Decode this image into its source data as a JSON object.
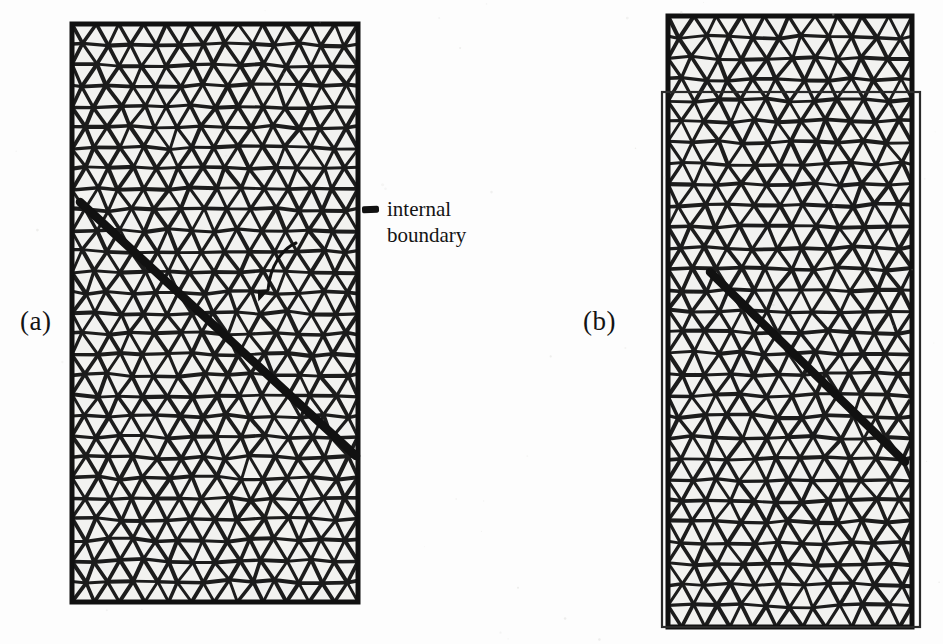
{
  "figure": {
    "kind": "finite-element-mesh-figure",
    "background_color": "#fdfdfd",
    "line_color": "#1c1c1c",
    "face_color": "#f2f2f0",
    "panels": [
      {
        "id": "a",
        "label": "(a)",
        "label_x": 20,
        "label_y": 306,
        "mesh": {
          "x": 72,
          "y": 24,
          "width": 286,
          "height": 578,
          "cell_size": 24.0,
          "border_width": 5,
          "edge_width": 3.4,
          "jitter": 2.6,
          "seed": 17
        },
        "outer_rect": null,
        "internal_boundary": {
          "x1": 80,
          "y1": 202,
          "x2": 356,
          "y2": 456,
          "width": 8.5
        }
      },
      {
        "id": "b",
        "label": "(b)",
        "label_x": 583,
        "label_y": 306,
        "mesh": {
          "x": 668,
          "y": 16,
          "width": 244,
          "height": 611,
          "cell_size": 24.0,
          "border_width": 5,
          "edge_width": 3.4,
          "jitter": 2.6,
          "seed": 43
        },
        "outer_rect": {
          "x": 662,
          "y": 92,
          "width": 258,
          "height": 535,
          "width_px": 2.2
        },
        "internal_boundary": {
          "x1": 710,
          "y1": 272,
          "x2": 905,
          "y2": 462,
          "width": 8.5
        }
      }
    ],
    "annotation": {
      "line1": "internal",
      "line2": "boundary",
      "text_x": 387,
      "text_y": 196,
      "leader": {
        "dash_x": 362,
        "dash_y": 206,
        "dash_w": 17,
        "dash_h": 7,
        "arrow": {
          "x1": 296,
          "y1": 243,
          "x2": 268,
          "y2": 290
        }
      }
    }
  }
}
